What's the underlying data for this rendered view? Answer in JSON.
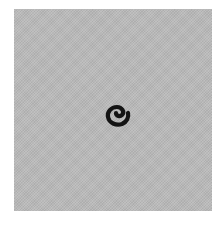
{
  "figure": {
    "background_color": "#ffffff",
    "panel_color": "#b9b9b9",
    "glyph": {
      "name": "spiral",
      "color": "#141414"
    }
  }
}
